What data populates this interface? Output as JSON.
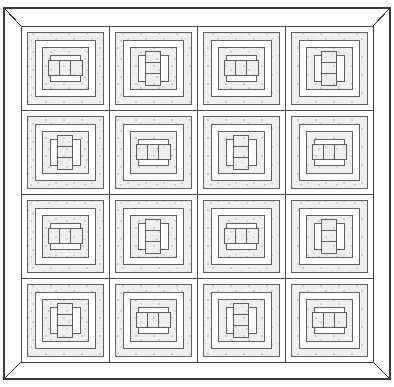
{
  "figure": {
    "kind": "quilt-block-layout-diagram",
    "width": 394,
    "height": 387
  },
  "colors": {
    "outline": "#3a3a3a",
    "outline_light": "#6e6e6e",
    "fabric_light": "#ffffff",
    "fabric_textured": "#ededed",
    "fabric_texture_speckle": "#d2d2d2",
    "background": "#ffffff"
  },
  "line_widths": {
    "border_outer": 1.2,
    "block_outline": 0.9,
    "inner_detail": 0.8,
    "miter_diagonal": 1.0
  },
  "border": {
    "name": "mitered-outer-border",
    "outer": {
      "x": 4,
      "y": 8,
      "width": 386,
      "height": 371
    },
    "inner": {
      "x": 21,
      "y": 26,
      "width": 352,
      "height": 336
    },
    "miter_corners": [
      "top-left",
      "top-right",
      "bottom-right",
      "bottom-left"
    ],
    "fill": "#ffffff"
  },
  "grid": {
    "rows": 4,
    "columns": 4,
    "block_count": 16,
    "origin_x": 21,
    "origin_y": 26,
    "cell_width": 88,
    "cell_height": 84
  },
  "block": {
    "description": "Concentric log-cabin frame: outer textured ring, white ring, textured ring, white ring, then small 3-cell center bar.",
    "rings": [
      {
        "index": 0,
        "inset": 0,
        "fill": "fabric_light"
      },
      {
        "index": 1,
        "inset": 6,
        "fill": "fabric_textured"
      },
      {
        "index": 2,
        "inset": 14,
        "fill": "fabric_light"
      },
      {
        "index": 3,
        "inset": 21,
        "fill": "fabric_textured"
      },
      {
        "index": 4,
        "inset": 29,
        "fill": "fabric_light"
      }
    ],
    "center_unit": {
      "cells": 3,
      "horizontal_size": {
        "width": 34,
        "height": 15
      },
      "vertical_size": {
        "width": 15,
        "height": 34
      },
      "fill": "fabric_textured"
    }
  },
  "blocks": [
    {
      "id": "block-r1c1",
      "row": 1,
      "col": 1,
      "orientation": "horizontal"
    },
    {
      "id": "block-r1c2",
      "row": 1,
      "col": 2,
      "orientation": "vertical"
    },
    {
      "id": "block-r1c3",
      "row": 1,
      "col": 3,
      "orientation": "horizontal"
    },
    {
      "id": "block-r1c4",
      "row": 1,
      "col": 4,
      "orientation": "vertical"
    },
    {
      "id": "block-r2c1",
      "row": 2,
      "col": 1,
      "orientation": "vertical"
    },
    {
      "id": "block-r2c2",
      "row": 2,
      "col": 2,
      "orientation": "horizontal"
    },
    {
      "id": "block-r2c3",
      "row": 2,
      "col": 3,
      "orientation": "vertical"
    },
    {
      "id": "block-r2c4",
      "row": 2,
      "col": 4,
      "orientation": "horizontal"
    },
    {
      "id": "block-r3c1",
      "row": 3,
      "col": 1,
      "orientation": "horizontal"
    },
    {
      "id": "block-r3c2",
      "row": 3,
      "col": 2,
      "orientation": "vertical"
    },
    {
      "id": "block-r3c3",
      "row": 3,
      "col": 3,
      "orientation": "horizontal"
    },
    {
      "id": "block-r3c4",
      "row": 3,
      "col": 4,
      "orientation": "vertical"
    },
    {
      "id": "block-r4c1",
      "row": 4,
      "col": 1,
      "orientation": "vertical"
    },
    {
      "id": "block-r4c2",
      "row": 4,
      "col": 2,
      "orientation": "horizontal"
    },
    {
      "id": "block-r4c3",
      "row": 4,
      "col": 3,
      "orientation": "vertical"
    },
    {
      "id": "block-r4c4",
      "row": 4,
      "col": 4,
      "orientation": "horizontal"
    }
  ]
}
